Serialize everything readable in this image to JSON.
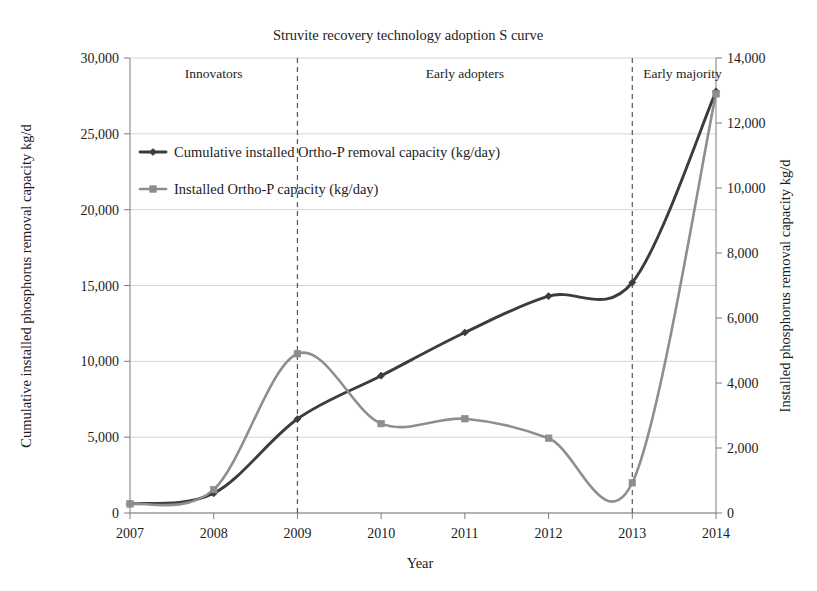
{
  "chart_data": {
    "type": "line",
    "title": "Struvite recovery technology adoption S curve",
    "xlabel": "Year",
    "ylabel": "Cumulative installed phosphorus removal capacity kg/d",
    "y2label": "Installed phosphorus removal capacity kg/d",
    "x": [
      "2007",
      "2008",
      "2009",
      "2010",
      "2011",
      "2012",
      "2013",
      "2014"
    ],
    "xlim": [
      2007,
      2014
    ],
    "ylim": [
      0,
      30000
    ],
    "y2lim": [
      0,
      14000
    ],
    "yticks": [
      "0",
      "5,000",
      "10,000",
      "15,000",
      "20,000",
      "25,000",
      "30,000"
    ],
    "ytick_values": [
      0,
      5000,
      10000,
      15000,
      20000,
      25000,
      30000
    ],
    "y2ticks": [
      "0",
      "2,000",
      "4,000",
      "6,000",
      "8,000",
      "10,000",
      "12,000",
      "14,000"
    ],
    "y2tick_values": [
      0,
      2000,
      4000,
      6000,
      8000,
      10000,
      12000,
      14000
    ],
    "grid": true,
    "legend_position": "upper left",
    "series": [
      {
        "name": "Cumulative installed Ortho-P removal capacity (kg/day)",
        "axis": "left",
        "color": "#3c3c3c",
        "values": [
          600,
          1300,
          6200,
          9050,
          11900,
          14300,
          15200,
          27800
        ]
      },
      {
        "name": "Installed Ortho-P capacity (kg/day)",
        "axis": "right",
        "color": "#8e8e8e",
        "values": [
          280,
          720,
          4900,
          2750,
          2900,
          2300,
          930,
          12900
        ]
      }
    ],
    "annotations": [
      {
        "label": "Innovators",
        "at_year": 2008.0,
        "boundary_year": 2009
      },
      {
        "label": "Early adopters",
        "at_year": 2011.0,
        "boundary_year": 2013
      },
      {
        "label": "Early majority",
        "at_year": 2013.6,
        "boundary_year": null
      }
    ],
    "dividers": [
      2009,
      2013
    ]
  },
  "legend": {
    "items": [
      {
        "label": "Cumulative installed Ortho-P removal capacity (kg/day)",
        "color": "#3c3c3c"
      },
      {
        "label": "Installed Ortho-P capacity (kg/day)",
        "color": "#8e8e8e"
      }
    ]
  }
}
